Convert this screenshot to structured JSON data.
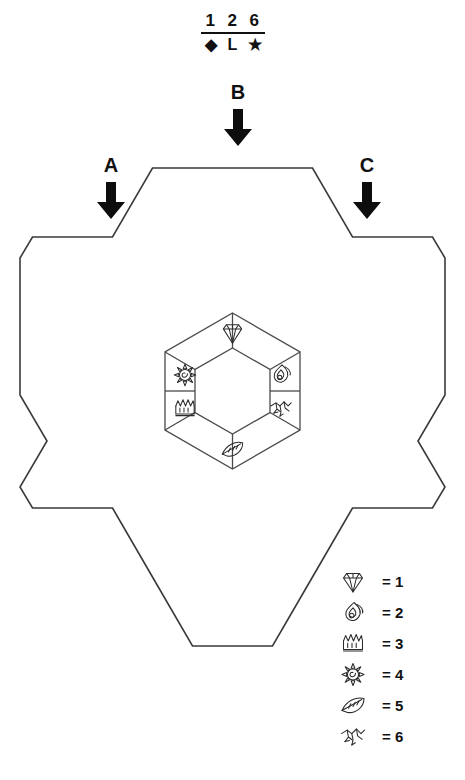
{
  "header_code": {
    "name": "cipher-key",
    "digits": [
      "1",
      "2",
      "6"
    ],
    "symbols": [
      "◆",
      "L",
      "★"
    ]
  },
  "arrows": [
    {
      "label": "A",
      "icon": "down-arrow-icon"
    },
    {
      "label": "B",
      "icon": "down-arrow-icon"
    },
    {
      "label": "C",
      "icon": "down-arrow-icon"
    }
  ],
  "board": {
    "outline_name": "hex-flower-outline",
    "stroke": "#3a3a3a",
    "fill": "#ffffff"
  },
  "inner_hex": {
    "name": "inner-hex-ring",
    "center_empty": true,
    "cells": [
      {
        "position": "top",
        "icon": "diamond-icon",
        "value": "1"
      },
      {
        "position": "upper-right",
        "icon": "flame-icon",
        "value": "2"
      },
      {
        "position": "lower-right",
        "icon": "bird-icon",
        "value": "6"
      },
      {
        "position": "bottom",
        "icon": "leaf-icon",
        "value": "5"
      },
      {
        "position": "lower-left",
        "icon": "crown-icon",
        "value": "3"
      },
      {
        "position": "upper-left",
        "icon": "sun-icon",
        "value": "4"
      }
    ]
  },
  "legend": {
    "name": "symbol-legend",
    "entries": [
      {
        "icon": "diamond-icon",
        "text": "= 1"
      },
      {
        "icon": "flame-icon",
        "text": "= 2"
      },
      {
        "icon": "crown-icon",
        "text": "= 3"
      },
      {
        "icon": "sun-icon",
        "text": "= 4"
      },
      {
        "icon": "leaf-icon",
        "text": "= 5"
      },
      {
        "icon": "bird-icon",
        "text": "= 6"
      }
    ]
  }
}
